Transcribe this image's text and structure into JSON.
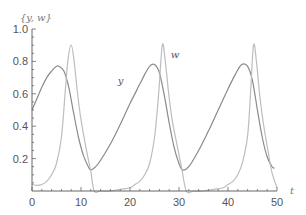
{
  "chart_data": {
    "type": "line",
    "title": "",
    "xlabel": "t",
    "ylabel": "{y, w}",
    "xlim": [
      0,
      50
    ],
    "ylim": [
      0,
      1.0
    ],
    "grid": false,
    "legend": "inline curve labels",
    "x_ticks": [
      0,
      10,
      20,
      30,
      40,
      50
    ],
    "x_tick_labels": [
      "0",
      "10",
      "20",
      "30",
      "40",
      "50"
    ],
    "y_ticks": [
      0.2,
      0.4,
      0.6,
      0.8,
      1.0
    ],
    "y_tick_labels": [
      "0.2",
      "0.4",
      "0.6",
      "0.8",
      "1.0"
    ],
    "annotations": [
      {
        "text": "y",
        "t": 17.5,
        "value": 0.66
      },
      {
        "text": "w",
        "t": 28.3,
        "value": 0.82
      }
    ],
    "series": [
      {
        "name": "y",
        "color": "#8a8a8a",
        "t": [
          0,
          1,
          2,
          3,
          4,
          5,
          5.5,
          6.5,
          7.5,
          8.5,
          9.5,
          10.5,
          11.5,
          12.0,
          13,
          14,
          16,
          18,
          20,
          22,
          23,
          24,
          25,
          26,
          27,
          28,
          29,
          30,
          30.7,
          32,
          34,
          36,
          38,
          40,
          41.5,
          42.8,
          44,
          45,
          46,
          47,
          48,
          49,
          49.5
        ],
        "values": [
          0.5,
          0.57,
          0.64,
          0.7,
          0.74,
          0.77,
          0.77,
          0.74,
          0.64,
          0.48,
          0.33,
          0.22,
          0.15,
          0.13,
          0.15,
          0.19,
          0.29,
          0.41,
          0.54,
          0.66,
          0.72,
          0.77,
          0.78,
          0.73,
          0.59,
          0.42,
          0.27,
          0.17,
          0.13,
          0.15,
          0.25,
          0.37,
          0.5,
          0.63,
          0.72,
          0.78,
          0.77,
          0.68,
          0.5,
          0.33,
          0.21,
          0.15,
          0.14
        ]
      },
      {
        "name": "w",
        "color": "#bdbdbd",
        "t": [
          0,
          1,
          2,
          3,
          4,
          5,
          6,
          6.7,
          7.3,
          8.0,
          8.6,
          9.3,
          10,
          11,
          12,
          12.7,
          14,
          16,
          18,
          20,
          21,
          22,
          23,
          24,
          25,
          25.8,
          26.6,
          27.2,
          27.9,
          28.6,
          29.5,
          30.5,
          31.5,
          33,
          35,
          37,
          39,
          40,
          41,
          42,
          43,
          44,
          44.6,
          45.2,
          45.8,
          46.5,
          47.3,
          48.2,
          49,
          50
        ],
        "values": [
          0.04,
          0.035,
          0.04,
          0.06,
          0.1,
          0.17,
          0.33,
          0.58,
          0.8,
          0.9,
          0.8,
          0.6,
          0.44,
          0.27,
          0.12,
          0.0,
          0.0,
          0.0,
          0.01,
          0.02,
          0.04,
          0.06,
          0.1,
          0.17,
          0.33,
          0.58,
          0.9,
          0.8,
          0.6,
          0.44,
          0.3,
          0.15,
          0.0,
          0.0,
          0.0,
          0.01,
          0.02,
          0.04,
          0.06,
          0.1,
          0.18,
          0.34,
          0.6,
          0.9,
          0.8,
          0.58,
          0.4,
          0.24,
          0.11,
          0.02
        ]
      }
    ]
  }
}
